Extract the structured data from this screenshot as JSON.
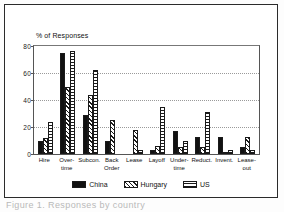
{
  "figure": {
    "caption": "Figure 1. Responses by country",
    "ylabel": "% of Responses"
  },
  "axis": {
    "yticks": [
      "0",
      "20",
      "40",
      "60",
      "80"
    ]
  },
  "legend": {
    "items": [
      {
        "label": "China",
        "pattern": "solid-black",
        "color": "#111111"
      },
      {
        "label": "Hungary",
        "pattern": "diagonal-hatch",
        "color": "#1a1a1a"
      },
      {
        "label": "US",
        "pattern": "crosshatch-grid",
        "color": "#1a1a1a"
      }
    ]
  },
  "chart_data": {
    "type": "bar",
    "title": "",
    "xlabel": "",
    "ylabel": "% of Responses",
    "ylim": [
      0,
      80
    ],
    "yticks": [
      0,
      20,
      40,
      60,
      80
    ],
    "grid": true,
    "legend_position": "bottom-center",
    "categories": [
      "Hire",
      "Over-\ntime",
      "Subcon.",
      "Back\nOrder",
      "Lease",
      "Layoff",
      "Under-\ntime",
      "Reduct.",
      "Invent.",
      "Lease-\nout"
    ],
    "series": [
      {
        "name": "China",
        "values": [
          10,
          75,
          29,
          10,
          0,
          3,
          17,
          12.5,
          12.5,
          5
        ]
      },
      {
        "name": "Hungary",
        "values": [
          12,
          50,
          44,
          25,
          18,
          6,
          5,
          5,
          1,
          12.5
        ]
      },
      {
        "name": "US",
        "values": [
          24,
          76,
          62,
          0,
          3,
          35,
          10,
          31,
          3,
          3
        ]
      }
    ]
  }
}
